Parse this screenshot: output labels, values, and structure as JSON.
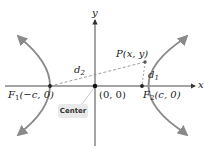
{
  "diagram": {
    "axes": {
      "x_label": "x",
      "y_label": "y"
    },
    "origin_label": "(0, 0)",
    "point": {
      "label": "P(x, y)"
    },
    "foci": [
      {
        "name": "F1",
        "label_main": "F",
        "label_sub": "1",
        "coords": "(−c, 0)"
      },
      {
        "name": "F2",
        "label_main": "F",
        "label_sub": "2",
        "coords": "(c, 0)"
      }
    ],
    "distances": [
      {
        "main": "d",
        "sub": "2"
      },
      {
        "main": "d",
        "sub": "1"
      }
    ],
    "center_badge": "Center",
    "colors": {
      "curve": "#8a8a8a",
      "axis": "#333333",
      "dashed": "#888888",
      "badge_bg": "#e9e9e9"
    }
  }
}
